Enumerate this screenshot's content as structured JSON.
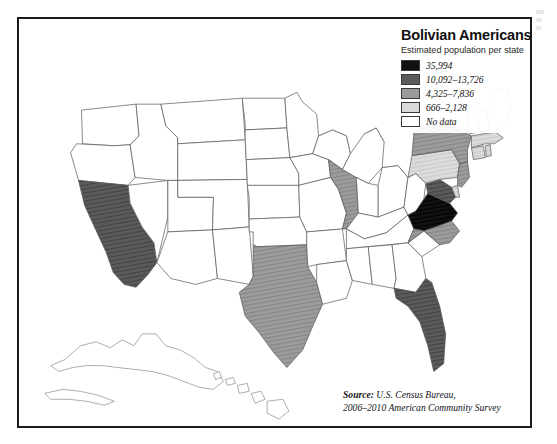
{
  "legend": {
    "title": "Bolivian Americans",
    "subtitle": "Estimated population per state",
    "entries": [
      {
        "label": "35,994",
        "color": "#111111"
      },
      {
        "label": "10,092–13,726",
        "color": "#5b5b5b"
      },
      {
        "label": "4,325–7,836",
        "color": "#9a9a9a"
      },
      {
        "label": "666–2,128",
        "color": "#d9d9d9"
      },
      {
        "label": "No data",
        "color": "#ffffff"
      }
    ]
  },
  "source": {
    "prefix": "Source:",
    "line1": "U.S. Census Bureau,",
    "line2": "2006–2010 American Community Survey"
  },
  "map_data": {
    "type": "choropleth",
    "region": "United States",
    "variable": "Estimated Bolivian American population per state",
    "classes": [
      {
        "index": 0,
        "label": "35,994",
        "color": "#111111",
        "min": 35994,
        "max": 35994
      },
      {
        "index": 1,
        "label": "10,092–13,726",
        "color": "#5b5b5b",
        "min": 10092,
        "max": 13726
      },
      {
        "index": 2,
        "label": "4,325–7,836",
        "color": "#9a9a9a",
        "min": 4325,
        "max": 7836
      },
      {
        "index": 3,
        "label": "666–2,128",
        "color": "#d9d9d9",
        "min": 666,
        "max": 2128
      },
      {
        "index": 4,
        "label": "No data",
        "color": "#ffffff",
        "min": null,
        "max": null
      }
    ],
    "states": [
      {
        "code": "VA",
        "name": "Virginia",
        "class": 0
      },
      {
        "code": "CA",
        "name": "California",
        "class": 1
      },
      {
        "code": "FL",
        "name": "Florida",
        "class": 1
      },
      {
        "code": "MD",
        "name": "Maryland",
        "class": 1
      },
      {
        "code": "TX",
        "name": "Texas",
        "class": 2
      },
      {
        "code": "NY",
        "name": "New York",
        "class": 2
      },
      {
        "code": "NJ",
        "name": "New Jersey",
        "class": 2
      },
      {
        "code": "IL",
        "name": "Illinois",
        "class": 2
      },
      {
        "code": "NC",
        "name": "North Carolina",
        "class": 2
      },
      {
        "code": "PA",
        "name": "Pennsylvania",
        "class": 3
      },
      {
        "code": "CT",
        "name": "Connecticut",
        "class": 3
      },
      {
        "code": "MA",
        "name": "Massachusetts",
        "class": 3
      },
      {
        "code": "RI",
        "name": "Rhode Island",
        "class": 3
      },
      {
        "code": "DE",
        "name": "Delaware",
        "class": 3
      },
      {
        "code": "WA",
        "name": "Washington",
        "class": 4
      },
      {
        "code": "OR",
        "name": "Oregon",
        "class": 4
      },
      {
        "code": "NV",
        "name": "Nevada",
        "class": 4
      },
      {
        "code": "ID",
        "name": "Idaho",
        "class": 4
      },
      {
        "code": "MT",
        "name": "Montana",
        "class": 4
      },
      {
        "code": "WY",
        "name": "Wyoming",
        "class": 4
      },
      {
        "code": "UT",
        "name": "Utah",
        "class": 4
      },
      {
        "code": "AZ",
        "name": "Arizona",
        "class": 4
      },
      {
        "code": "CO",
        "name": "Colorado",
        "class": 4
      },
      {
        "code": "NM",
        "name": "New Mexico",
        "class": 4
      },
      {
        "code": "ND",
        "name": "North Dakota",
        "class": 4
      },
      {
        "code": "SD",
        "name": "South Dakota",
        "class": 4
      },
      {
        "code": "NE",
        "name": "Nebraska",
        "class": 4
      },
      {
        "code": "KS",
        "name": "Kansas",
        "class": 4
      },
      {
        "code": "OK",
        "name": "Oklahoma",
        "class": 4
      },
      {
        "code": "MN",
        "name": "Minnesota",
        "class": 4
      },
      {
        "code": "IA",
        "name": "Iowa",
        "class": 4
      },
      {
        "code": "MO",
        "name": "Missouri",
        "class": 4
      },
      {
        "code": "AR",
        "name": "Arkansas",
        "class": 4
      },
      {
        "code": "LA",
        "name": "Louisiana",
        "class": 4
      },
      {
        "code": "WI",
        "name": "Wisconsin",
        "class": 4
      },
      {
        "code": "MI",
        "name": "Michigan",
        "class": 4
      },
      {
        "code": "IN",
        "name": "Indiana",
        "class": 4
      },
      {
        "code": "OH",
        "name": "Ohio",
        "class": 4
      },
      {
        "code": "KY",
        "name": "Kentucky",
        "class": 4
      },
      {
        "code": "TN",
        "name": "Tennessee",
        "class": 4
      },
      {
        "code": "MS",
        "name": "Mississippi",
        "class": 4
      },
      {
        "code": "AL",
        "name": "Alabama",
        "class": 4
      },
      {
        "code": "GA",
        "name": "Georgia",
        "class": 4
      },
      {
        "code": "SC",
        "name": "South Carolina",
        "class": 4
      },
      {
        "code": "WV",
        "name": "West Virginia",
        "class": 4
      },
      {
        "code": "VT",
        "name": "Vermont",
        "class": 4
      },
      {
        "code": "NH",
        "name": "New Hampshire",
        "class": 4
      },
      {
        "code": "ME",
        "name": "Maine",
        "class": 4
      },
      {
        "code": "AK",
        "name": "Alaska",
        "class": 4
      },
      {
        "code": "HI",
        "name": "Hawaii",
        "class": 4
      }
    ]
  }
}
